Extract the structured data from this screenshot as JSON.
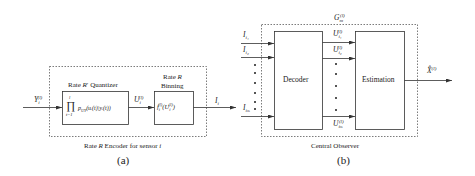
{
  "figure_a": {
    "caption": "Rate R Encoder for sensor i",
    "caption_parts": {
      "pre": "Rate ",
      "R": "R",
      "mid": " Encoder for sensor ",
      "i": "i"
    },
    "label": "(a)",
    "input": {
      "symbol": "Y",
      "sub": "i",
      "sup": "(l)"
    },
    "quantizer": {
      "title_pre": "Rate ",
      "title_R": "R",
      "title_prime": "′",
      "title_post": " Quantizer",
      "product_symbol": "∏",
      "product_upper": "l",
      "product_lower": "t=1",
      "formula": "p",
      "formula_sub": "UY",
      "formula_body": "(uᵢ(t)|yᵢ(t))"
    },
    "intermediate": {
      "symbol": "U",
      "sub": "i",
      "sup": "(l)"
    },
    "binning": {
      "title_line1_pre": "Rate ",
      "title_line1_R": "R",
      "title_line2": "Binning",
      "formula": "f",
      "formula_sub": "i",
      "formula_sup": "(l)",
      "formula_arg": "(U",
      "formula_arg_sub": "i",
      "formula_arg_sup": "(l)",
      "formula_close": ")"
    },
    "output": {
      "symbol": "I",
      "sub": "i"
    }
  },
  "figure_b": {
    "caption": "Central Observer",
    "label": "(b)",
    "group_label": {
      "symbol": "G",
      "sub": "m",
      "sup": "(l)"
    },
    "inputs": [
      {
        "symbol": "I",
        "sub": "i₁"
      },
      {
        "symbol": "I",
        "sub": "i₂"
      },
      {
        "symbol": "I",
        "sub": "iₘ"
      }
    ],
    "decoder_label": "Decoder",
    "decoded": [
      {
        "symbol": "U",
        "sub": "i₁",
        "sup": "(l)"
      },
      {
        "symbol": "U",
        "sub": "i₂",
        "sup": "(l)"
      },
      {
        "symbol": "U",
        "sub": "iₘ",
        "sup": "(l)"
      }
    ],
    "estimation_label": "Estimation",
    "output": {
      "symbol": "X̂",
      "sup": "(l)"
    }
  }
}
